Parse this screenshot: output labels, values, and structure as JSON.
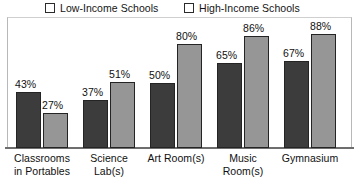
{
  "chart_data": {
    "type": "bar",
    "title": "",
    "subtitle": "",
    "xlabel": "",
    "ylabel": "",
    "ylim": [
      0,
      100
    ],
    "grid": false,
    "legend_position": "top",
    "value_suffix": "%",
    "categories": [
      "Classrooms in Portables",
      "Science Lab(s)",
      "Art Room(s)",
      "Music Room(s)",
      "Gymnasium"
    ],
    "category_lines": [
      [
        "Classrooms",
        "in Portables"
      ],
      [
        "Science",
        "Lab(s)"
      ],
      [
        "Art Room(s)"
      ],
      [
        "Music",
        "Room(s)"
      ],
      [
        "Gymnasium"
      ]
    ],
    "series": [
      {
        "name": "Low-Income Schools",
        "color": "#3c3c3c",
        "values": [
          43,
          37,
          50,
          65,
          67
        ],
        "labels": [
          "43%",
          "37%",
          "50%",
          "65%",
          "67%"
        ]
      },
      {
        "name": "High-Income Schools",
        "color": "#969696",
        "values": [
          27,
          51,
          80,
          86,
          88
        ],
        "labels": [
          "27%",
          "51%",
          "80%",
          "86%",
          "88%"
        ]
      }
    ]
  },
  "legend": {
    "items": [
      {
        "label": "Low-Income Schools",
        "color": "#3c3c3c"
      },
      {
        "label": "High-Income Schools",
        "color": "#969696"
      }
    ]
  },
  "axis": {
    "baseline_color": "#6e6e6e",
    "frame_color": "#b8b8b8"
  }
}
